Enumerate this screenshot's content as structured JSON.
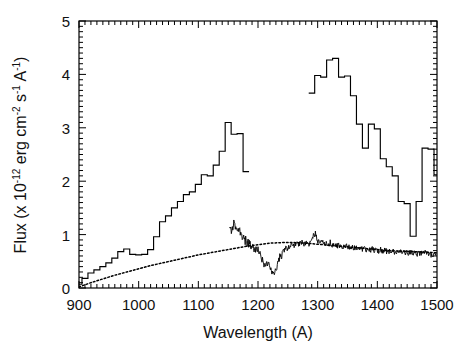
{
  "figure": {
    "background_color": "#ffffff",
    "line_color": "#000000",
    "width": 471,
    "height": 350
  },
  "axes": {
    "x_title": "Wavelength (A)",
    "y_title_parts": {
      "prefix": "Flux (x 10",
      "exp1": "-12",
      "mid1": " erg cm",
      "exp2": "-2",
      "mid2": " s",
      "exp3": "-1",
      "mid3": " A",
      "exp4": "-1",
      "suffix": ")"
    },
    "y_title_plain": "Flux (x 10-12 erg cm-2 s-1 A-1)",
    "x_ticks": [
      "900",
      "1000",
      "1100",
      "1200",
      "1300",
      "1400",
      "1500"
    ],
    "y_ticks": [
      "0",
      "1",
      "2",
      "3",
      "4",
      "5"
    ],
    "x_minor_step": 10,
    "y_minor_step": 0.1,
    "box": {
      "left": 79,
      "top": 21,
      "right": 437,
      "bottom": 288
    }
  },
  "chart_data": {
    "type": "line",
    "title": "",
    "xlabel": "Wavelength (A)",
    "ylabel": "Flux (x 10-12 erg cm-2 s-1 A-1)",
    "xlim": [
      900,
      1500
    ],
    "ylim": [
      0,
      5
    ],
    "grid": false,
    "legend": "none",
    "series": [
      {
        "name": "low-resolution-histogram-spectrum",
        "style": "step",
        "x": [
          900,
          910,
          920,
          930,
          940,
          950,
          960,
          970,
          980,
          990,
          1000,
          1010,
          1020,
          1030,
          1040,
          1050,
          1060,
          1070,
          1080,
          1090,
          1100,
          1110,
          1120,
          1130,
          1140,
          1150,
          1160,
          1170,
          1180
        ],
        "y": [
          0.07,
          0.18,
          0.28,
          0.34,
          0.4,
          0.47,
          0.56,
          0.68,
          0.73,
          0.63,
          0.62,
          0.63,
          0.72,
          0.96,
          1.24,
          1.35,
          1.5,
          1.62,
          1.75,
          1.8,
          1.94,
          2.12,
          2.1,
          2.3,
          2.56,
          3.1,
          2.88,
          2.89,
          2.18
        ]
      },
      {
        "name": "low-resolution-histogram-spectrum-red",
        "style": "step",
        "x": [
          1290,
          1300,
          1310,
          1320,
          1330,
          1340,
          1350,
          1360,
          1370,
          1380,
          1390,
          1400,
          1410,
          1420,
          1430,
          1440,
          1450,
          1460,
          1470,
          1480,
          1490,
          1500
        ],
        "y": [
          3.65,
          3.98,
          3.95,
          4.27,
          4.3,
          3.95,
          3.97,
          3.6,
          3.07,
          2.62,
          3.07,
          2.98,
          2.42,
          2.27,
          2.1,
          1.62,
          1.58,
          0.97,
          1.62,
          2.62,
          2.6,
          2.12
        ]
      },
      {
        "name": "smooth-model-continuum-dotted",
        "style": "dotted",
        "x": [
          900,
          920,
          940,
          960,
          980,
          1000,
          1020,
          1040,
          1060,
          1080,
          1100,
          1120,
          1140,
          1160,
          1180,
          1200,
          1220,
          1240,
          1260,
          1280,
          1300,
          1320,
          1340,
          1360,
          1380,
          1400,
          1420,
          1440,
          1460,
          1480,
          1500
        ],
        "y": [
          0.02,
          0.1,
          0.17,
          0.24,
          0.3,
          0.36,
          0.42,
          0.47,
          0.52,
          0.57,
          0.62,
          0.66,
          0.7,
          0.74,
          0.78,
          0.81,
          0.84,
          0.85,
          0.85,
          0.84,
          0.82,
          0.8,
          0.78,
          0.76,
          0.74,
          0.72,
          0.7,
          0.69,
          0.68,
          0.67,
          0.66
        ]
      },
      {
        "name": "high-resolution-noisy-spectrum",
        "style": "noisy-line",
        "x_start": 1152,
        "x_end": 1500,
        "description": "noisy echelle spectrum with broad Lyman-alpha absorption trough near 1215 A dipping to about 0.25, rising back to roughly 0.85 by 1260 A and slowly declining to about 0.62 at 1500 A",
        "x": [
          1152,
          1156,
          1160,
          1164,
          1168,
          1172,
          1176,
          1180,
          1184,
          1188,
          1192,
          1196,
          1200,
          1204,
          1208,
          1212,
          1216,
          1220,
          1224,
          1228,
          1232,
          1236,
          1240,
          1244,
          1248,
          1252,
          1256,
          1260,
          1264,
          1268,
          1272,
          1276,
          1280,
          1284,
          1288,
          1292,
          1296,
          1300,
          1310,
          1320,
          1330,
          1340,
          1350,
          1360,
          1370,
          1380,
          1390,
          1400,
          1410,
          1420,
          1430,
          1440,
          1450,
          1460,
          1470,
          1480,
          1490,
          1500
        ],
        "y": [
          1.22,
          1.08,
          1.2,
          1.02,
          1.1,
          0.96,
          0.92,
          0.88,
          0.84,
          0.8,
          0.76,
          0.72,
          0.7,
          0.6,
          0.5,
          0.42,
          0.46,
          0.4,
          0.3,
          0.26,
          0.42,
          0.56,
          0.62,
          0.7,
          0.76,
          0.74,
          0.82,
          0.78,
          0.86,
          0.8,
          0.88,
          0.82,
          0.86,
          0.8,
          0.84,
          0.94,
          1.02,
          0.88,
          0.84,
          0.82,
          0.8,
          0.78,
          0.78,
          0.76,
          0.74,
          0.72,
          0.72,
          0.7,
          0.7,
          0.68,
          0.68,
          0.66,
          0.66,
          0.65,
          0.64,
          0.66,
          0.64,
          0.62
        ]
      }
    ]
  }
}
